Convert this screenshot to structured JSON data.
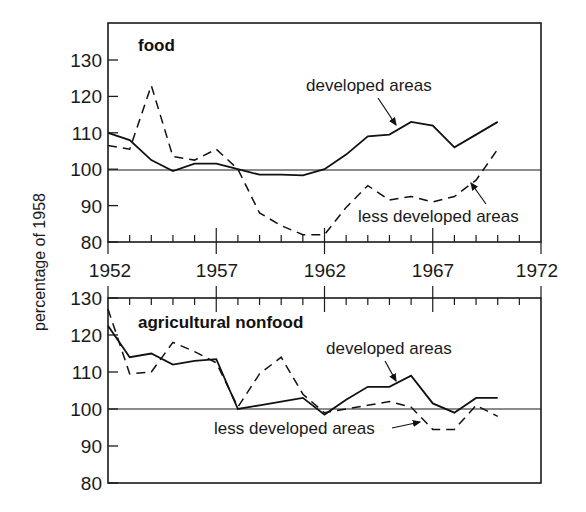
{
  "chart_data": [
    {
      "type": "line",
      "title": "food",
      "xlabel": "",
      "ylabel": "percentage of 1958",
      "ylim": [
        80,
        130
      ],
      "xlim": [
        1952,
        1972
      ],
      "yticks": [
        80,
        90,
        100,
        110,
        120,
        130
      ],
      "xticks": [
        1952,
        1957,
        1962,
        1967,
        1972
      ],
      "reference_line": 100,
      "grid": false,
      "x": [
        1952,
        1953,
        1954,
        1955,
        1956,
        1957,
        1958,
        1959,
        1960,
        1961,
        1962,
        1963,
        1964,
        1965,
        1966,
        1967,
        1968,
        1969,
        1970
      ],
      "series": [
        {
          "name": "developed areas",
          "style": "solid",
          "values": [
            110,
            108,
            102.5,
            99.5,
            101.5,
            101.5,
            100,
            98.5,
            98.5,
            98.3,
            100,
            104,
            109,
            109.5,
            113,
            112,
            106,
            109.5,
            113
          ]
        },
        {
          "name": "less developed areas",
          "style": "dashed",
          "values": [
            106.5,
            105.5,
            123,
            103.5,
            102.5,
            105.5,
            100,
            88,
            84.5,
            82,
            82,
            89.5,
            95.5,
            91.5,
            92.5,
            91,
            92.5,
            97,
            105.5
          ]
        }
      ],
      "annotations": [
        {
          "text": "developed areas",
          "points_to": "developed areas",
          "at_x": 1965.5
        },
        {
          "text": "less developed areas",
          "points_to": "less developed areas",
          "at_x": 1969
        }
      ]
    },
    {
      "type": "line",
      "title": "agricultural nonfood",
      "xlabel": "",
      "ylabel": "percentage of 1958",
      "ylim": [
        80,
        130
      ],
      "xlim": [
        1952,
        1972
      ],
      "yticks": [
        80,
        90,
        100,
        110,
        120,
        130
      ],
      "xticks": [
        1952,
        1957,
        1962,
        1967,
        1972
      ],
      "reference_line": 100,
      "grid": false,
      "x": [
        1952,
        1953,
        1954,
        1955,
        1956,
        1957,
        1958,
        1959,
        1960,
        1961,
        1962,
        1963,
        1964,
        1965,
        1966,
        1967,
        1968,
        1969,
        1970
      ],
      "series": [
        {
          "name": "developed areas",
          "style": "solid",
          "values": [
            122.5,
            114,
            115,
            112,
            113,
            113.5,
            100,
            101,
            102,
            103,
            98.5,
            102.5,
            106,
            106,
            109,
            101.5,
            99,
            103,
            103
          ]
        },
        {
          "name": "less developed areas",
          "style": "dashed",
          "values": [
            127,
            109.5,
            110,
            118,
            115.5,
            112.5,
            100.5,
            109.5,
            114,
            104,
            99,
            100,
            101,
            102,
            100.5,
            94.5,
            94.5,
            101,
            98
          ]
        }
      ],
      "annotations": [
        {
          "text": "developed areas",
          "points_to": "developed areas",
          "at_x": 1965.5
        },
        {
          "text": "less developed areas",
          "points_to": "less developed areas",
          "at_x": 1965
        }
      ]
    }
  ],
  "labels": {
    "ylabel": "percentage of 1958",
    "top_title": "food",
    "bottom_title": "agricultural nonfood",
    "developed": "developed areas",
    "less_developed": "less developed areas",
    "years": [
      "1952",
      "1957",
      "1962",
      "1967",
      "1972"
    ],
    "yvals": [
      "130",
      "120",
      "110",
      "100",
      "90",
      "80"
    ]
  }
}
